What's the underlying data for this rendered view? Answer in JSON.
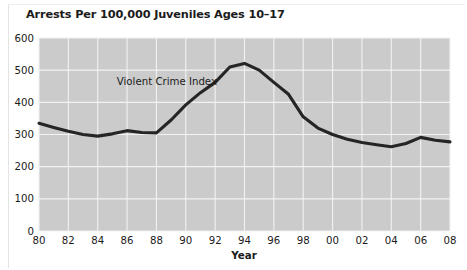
{
  "chart_data": {
    "type": "line",
    "title": "Arrests Per 100,000 Juveniles Ages 10–17",
    "xlabel": "Year",
    "ylabel": "",
    "xlim": [
      1980,
      2008
    ],
    "ylim": [
      0,
      600
    ],
    "y_ticks": [
      0,
      100,
      200,
      300,
      400,
      500,
      600
    ],
    "y_tick_labels": [
      "0",
      "100",
      "200",
      "300",
      "400",
      "500",
      "600"
    ],
    "x_ticks": [
      1980,
      1982,
      1984,
      1986,
      1988,
      1990,
      1992,
      1994,
      1996,
      1998,
      2000,
      2002,
      2004,
      2006,
      2008
    ],
    "x_tick_labels": [
      "80",
      "82",
      "84",
      "86",
      "88",
      "90",
      "92",
      "94",
      "96",
      "98",
      "00",
      "02",
      "04",
      "06",
      "08"
    ],
    "grid": true,
    "grid_color": "#f2f2f2",
    "plot_background": "#cbcbcb",
    "legend": "none",
    "annotations": [
      {
        "text": "Violent Crime Index",
        "x": 1985.3,
        "y": 455
      }
    ],
    "series": [
      {
        "name": "Violent Crime Index",
        "color": "#252525",
        "x": [
          1980,
          1981,
          1982,
          1983,
          1984,
          1985,
          1986,
          1987,
          1988,
          1989,
          1990,
          1991,
          1992,
          1993,
          1994,
          1995,
          1996,
          1997,
          1998,
          1999,
          2000,
          2001,
          2002,
          2003,
          2004,
          2005,
          2006,
          2007,
          2008
        ],
        "values": [
          335,
          322,
          310,
          300,
          295,
          302,
          312,
          306,
          305,
          345,
          392,
          430,
          462,
          510,
          521,
          500,
          462,
          425,
          355,
          320,
          300,
          285,
          275,
          268,
          262,
          272,
          291,
          282,
          277
        ]
      }
    ]
  },
  "axis_title": "Year"
}
